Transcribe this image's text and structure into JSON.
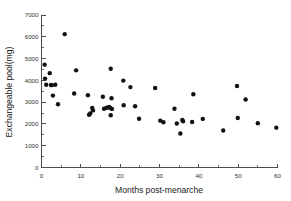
{
  "chart_data": {
    "type": "scatter",
    "title": "",
    "xlabel": "Months post-menarche",
    "ylabel": "Exchangeable pool(mg)",
    "xlim": [
      0,
      60
    ],
    "ylim": [
      0,
      7000
    ],
    "xticks": [
      0,
      10,
      20,
      30,
      40,
      50,
      60
    ],
    "xtick_labels": [
      "0",
      "10",
      "20",
      "30",
      "40",
      "50",
      "60"
    ],
    "yticks": [
      0,
      1000,
      2000,
      3000,
      4000,
      5000,
      6000,
      7000
    ],
    "ytick_labels": [
      "0",
      "1000",
      "2000",
      "3000",
      "4000",
      "5000",
      "6000",
      "7000"
    ],
    "x_minor_tick_interval": 5,
    "y_minor_tick_interval": 500,
    "grid": false,
    "legend": false,
    "marker": "filled-circle",
    "marker_color": "#111111",
    "marker_size": 2.2,
    "axis_color": "#4d4d4d",
    "background": "#ffffff",
    "n_points": 48,
    "points": [
      {
        "x": 0.8,
        "y": 4720
      },
      {
        "x": 0.9,
        "y": 4080
      },
      {
        "x": 1.2,
        "y": 3800
      },
      {
        "x": 2.1,
        "y": 4330
      },
      {
        "x": 2.4,
        "y": 3790
      },
      {
        "x": 2.6,
        "y": 3780
      },
      {
        "x": 2.9,
        "y": 3300
      },
      {
        "x": 3.5,
        "y": 3800
      },
      {
        "x": 4.2,
        "y": 2900
      },
      {
        "x": 5.9,
        "y": 6120
      },
      {
        "x": 8.8,
        "y": 4460
      },
      {
        "x": 8.3,
        "y": 3400
      },
      {
        "x": 11.8,
        "y": 3320
      },
      {
        "x": 12.1,
        "y": 2420
      },
      {
        "x": 12.4,
        "y": 2480
      },
      {
        "x": 12.9,
        "y": 2730
      },
      {
        "x": 13.1,
        "y": 2620
      },
      {
        "x": 15.6,
        "y": 3250
      },
      {
        "x": 15.9,
        "y": 2700
      },
      {
        "x": 16.6,
        "y": 2740
      },
      {
        "x": 17.2,
        "y": 2780
      },
      {
        "x": 17.4,
        "y": 2740
      },
      {
        "x": 17.6,
        "y": 4530
      },
      {
        "x": 17.8,
        "y": 3180
      },
      {
        "x": 17.9,
        "y": 2690
      },
      {
        "x": 17.6,
        "y": 2400
      },
      {
        "x": 20.8,
        "y": 3990
      },
      {
        "x": 20.9,
        "y": 2860
      },
      {
        "x": 22.6,
        "y": 3690
      },
      {
        "x": 23.8,
        "y": 2810
      },
      {
        "x": 24.8,
        "y": 2240
      },
      {
        "x": 28.9,
        "y": 3650
      },
      {
        "x": 30.2,
        "y": 2150
      },
      {
        "x": 31.0,
        "y": 2080
      },
      {
        "x": 33.8,
        "y": 2700
      },
      {
        "x": 34.4,
        "y": 2020
      },
      {
        "x": 35.3,
        "y": 1560
      },
      {
        "x": 35.8,
        "y": 2180
      },
      {
        "x": 36.0,
        "y": 2120
      },
      {
        "x": 38.6,
        "y": 3360
      },
      {
        "x": 38.3,
        "y": 2090
      },
      {
        "x": 41.0,
        "y": 2230
      },
      {
        "x": 46.2,
        "y": 1700
      },
      {
        "x": 49.7,
        "y": 3740
      },
      {
        "x": 49.9,
        "y": 2270
      },
      {
        "x": 51.9,
        "y": 3120
      },
      {
        "x": 55.0,
        "y": 2030
      },
      {
        "x": 59.7,
        "y": 1830
      }
    ]
  }
}
